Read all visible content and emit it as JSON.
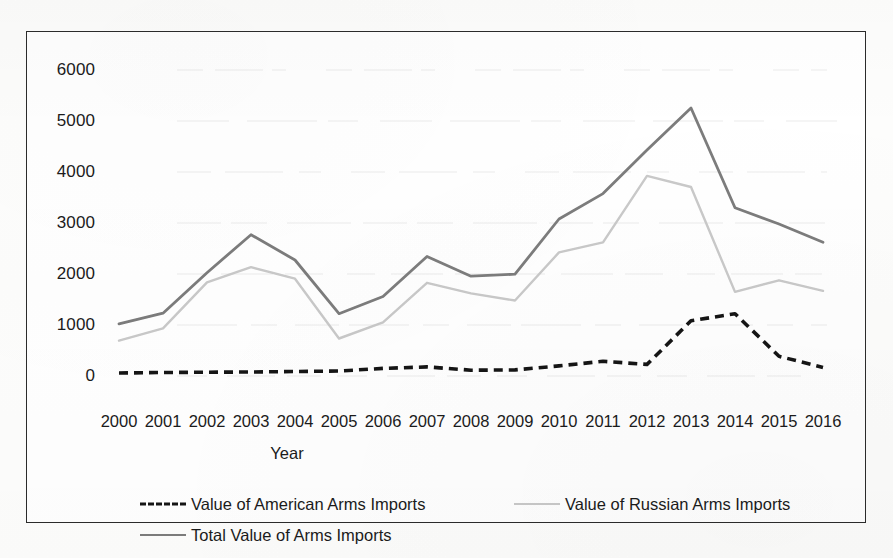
{
  "chart_data": {
    "type": "line",
    "title": "",
    "xlabel": "Year",
    "ylabel": "",
    "categories": [
      "2000",
      "2001",
      "2002",
      "2003",
      "2004",
      "2005",
      "2006",
      "2007",
      "2008",
      "2009",
      "2010",
      "2011",
      "2012",
      "2013",
      "2014",
      "2015",
      "2016"
    ],
    "x": [
      2000,
      2001,
      2002,
      2003,
      2004,
      2005,
      2006,
      2007,
      2008,
      2009,
      2010,
      2011,
      2012,
      2013,
      2014,
      2015,
      2016
    ],
    "xlim": [
      2000,
      2016
    ],
    "ylim": [
      0,
      6000
    ],
    "yticks": [
      0,
      1000,
      2000,
      3000,
      4000,
      5000,
      6000
    ],
    "ytick_labels": [
      "0",
      "1000",
      "2000",
      "3000",
      "4000",
      "5000",
      "6000"
    ],
    "grid": false,
    "legend_position": "bottom",
    "series": [
      {
        "name": "Value of American Arms Imports",
        "style": "dashed",
        "color": "#151515",
        "values": [
          20,
          30,
          35,
          40,
          50,
          60,
          110,
          140,
          75,
          80,
          160,
          250,
          190,
          1050,
          1190,
          350,
          130
        ]
      },
      {
        "name": "Value of Russian Arms Imports",
        "style": "solid",
        "color": "#c9c9c9",
        "values": [
          660,
          900,
          1810,
          2110,
          1880,
          700,
          1020,
          1800,
          1590,
          1450,
          2400,
          2600,
          3910,
          3690,
          1620,
          1850,
          1640
        ]
      },
      {
        "name": "Total Value of Arms Imports",
        "style": "solid",
        "color": "#7c7c7c",
        "values": [
          990,
          1200,
          2000,
          2750,
          2250,
          1190,
          1530,
          2320,
          1930,
          1970,
          3060,
          3560,
          4420,
          5250,
          3280,
          2960,
          2600
        ]
      }
    ]
  },
  "legend": {
    "entries": [
      {
        "label": "Value of American Arms Imports",
        "swatch": "dashed-black-line-icon"
      },
      {
        "label": "Value of Russian Arms Imports",
        "swatch": "light-gray-line-icon"
      },
      {
        "label": "Total Value of Arms Imports",
        "swatch": "dark-gray-line-icon"
      }
    ]
  },
  "axes": {
    "x_title": "Year"
  },
  "colors": {
    "american": "#151515",
    "russian": "#c9c9c9",
    "total": "#7c7c7c",
    "frame": "#2b2b2b",
    "text": "#1b1b1b",
    "background": "#ffffff"
  }
}
